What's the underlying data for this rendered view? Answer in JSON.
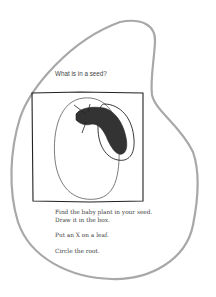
{
  "worksheet": {
    "question": "What is in a seed?",
    "instructions": [
      "Find the baby plant in your seed.",
      "Draw it in the box.",
      "Put an X on a leaf.",
      "Circle the root."
    ],
    "colors": {
      "outline": "#a8a8a8",
      "ink": "#222222",
      "text": "#444444"
    }
  }
}
